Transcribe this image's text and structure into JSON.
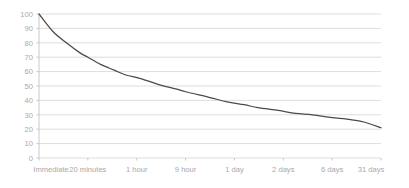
{
  "chart_data": {
    "type": "line",
    "title": "",
    "subtitle": "",
    "xlabel": "",
    "ylabel": "",
    "categories": [
      "Immediate",
      "20 minutes",
      "1 hour",
      "9 hour",
      "1 day",
      "2 days",
      "6 days",
      "31 days"
    ],
    "values": [
      100,
      58,
      44,
      36,
      29,
      27,
      25,
      21
    ],
    "series": [
      {
        "name": "Retention",
        "values": [
          100,
          58,
          44,
          36,
          29,
          27,
          25,
          21
        ]
      }
    ],
    "ylim": [
      0,
      100
    ],
    "yticks": [
      0,
      10,
      20,
      30,
      40,
      50,
      60,
      70,
      80,
      90,
      100
    ],
    "ytick_labels": [
      "0",
      "10",
      "20",
      "30",
      "40",
      "50",
      "60",
      "70",
      "80",
      "90",
      "100"
    ],
    "xtick_labels": [
      "Immediate",
      "20 minutes",
      "1 hour",
      "9 hour",
      "1 day",
      "2 days",
      "6 days",
      "31 days"
    ],
    "grid": true,
    "grid_axis": "y",
    "legend": false,
    "legend_position": "none",
    "annotations": [],
    "colors": {
      "line": "#4a4a4a",
      "grid": "#d9d9d9",
      "axis": "#c8c8c8",
      "tick_label": "#a9a9a9",
      "background": "#ffffff"
    },
    "curve_points": [
      {
        "x": 0.0,
        "y": 100
      },
      {
        "x": 0.04,
        "y": 88
      },
      {
        "x": 0.08,
        "y": 80
      },
      {
        "x": 0.12,
        "y": 73
      },
      {
        "x": 0.143,
        "y": 70
      },
      {
        "x": 0.18,
        "y": 65
      },
      {
        "x": 0.22,
        "y": 61
      },
      {
        "x": 0.25,
        "y": 58
      },
      {
        "x": 0.3,
        "y": 55
      },
      {
        "x": 0.35,
        "y": 51
      },
      {
        "x": 0.4,
        "y": 48
      },
      {
        "x": 0.429,
        "y": 46
      },
      {
        "x": 0.5,
        "y": 42
      },
      {
        "x": 0.55,
        "y": 39
      },
      {
        "x": 0.6,
        "y": 37
      },
      {
        "x": 0.64,
        "y": 35
      },
      {
        "x": 0.7,
        "y": 33
      },
      {
        "x": 0.75,
        "y": 31
      },
      {
        "x": 0.8,
        "y": 30
      },
      {
        "x": 0.857,
        "y": 28
      },
      {
        "x": 0.9,
        "y": 27
      },
      {
        "x": 0.95,
        "y": 25
      },
      {
        "x": 1.0,
        "y": 21
      }
    ]
  },
  "plot_geometry": {
    "left": 39,
    "right": 381,
    "top": 14,
    "bottom": 158
  }
}
